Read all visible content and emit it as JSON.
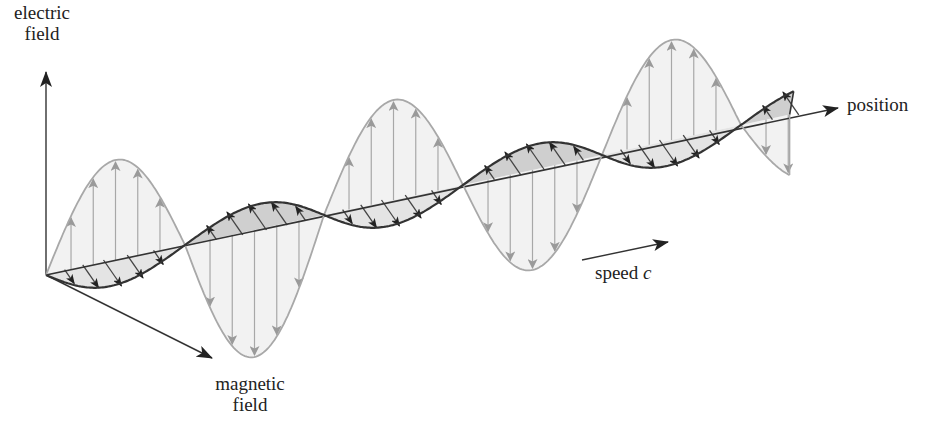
{
  "labels": {
    "electric_axis_line1": "electric",
    "electric_axis_line2": "field",
    "magnetic_axis_line1": "magnetic",
    "magnetic_axis_line2": "field",
    "position_axis": "position",
    "speed_text": "speed",
    "speed_symbol": "c"
  },
  "colors": {
    "electric_wave": "#a8a8a8",
    "electric_fill": "#f2f2f2",
    "magnetic_wave": "#333333",
    "magnetic_fill_light": "#e4e4e4",
    "magnetic_fill_dark": "#cfcfcf",
    "axis": "#333333",
    "text": "#222222"
  },
  "geometry": {
    "origin": [
      46,
      275
    ],
    "half_wavelength_step": [
      139,
      -30
    ],
    "half_cycles": 5,
    "tail_fraction": 0.35,
    "position_axis_tip": [
      838,
      108
    ],
    "electric_axis_tip": [
      46,
      72
    ],
    "magnetic_axis_tip": [
      212,
      358
    ],
    "electric_amplitudes": [
      100,
      127,
      100,
      100,
      100,
      68
    ],
    "magnetic_offset": [
      30,
      26
    ],
    "speed_arrow": [
      [
        582,
        260
      ],
      [
        668,
        242
      ]
    ]
  }
}
